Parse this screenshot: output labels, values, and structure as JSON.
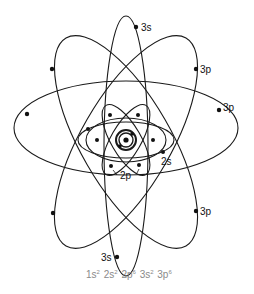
{
  "diagram": {
    "labels": {
      "s3_top": "3s",
      "p3_upper_right": "3p",
      "p3_right": "3p",
      "s2": "2s",
      "p2": "2p",
      "p3_lower_right": "3p",
      "s3_bottom": "3s"
    },
    "configuration": [
      {
        "orbital": "1s",
        "electrons": "2"
      },
      {
        "orbital": "2s",
        "electrons": "2"
      },
      {
        "orbital": "2p",
        "electrons": "6"
      },
      {
        "orbital": "3s",
        "electrons": "2"
      },
      {
        "orbital": "3p",
        "electrons": "6"
      }
    ],
    "colors": {
      "line": "#1a1a1a",
      "electron": "#111111",
      "configuration_text": "#8a8a8a"
    }
  }
}
